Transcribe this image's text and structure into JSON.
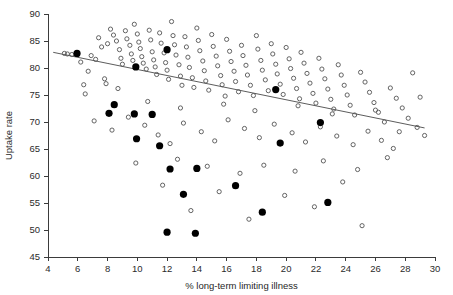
{
  "chart_data": {
    "type": "scatter",
    "title": "",
    "xlabel": "% long-term limiting illness",
    "ylabel": "Uptake rate",
    "xlim": [
      4,
      30
    ],
    "ylim": [
      45,
      90
    ],
    "xticks": [
      4,
      6,
      8,
      10,
      12,
      14,
      16,
      18,
      20,
      22,
      24,
      26,
      28,
      30
    ],
    "yticks": [
      45,
      50,
      55,
      60,
      65,
      70,
      75,
      80,
      85,
      90
    ],
    "grid": false,
    "legend": "none",
    "marker_colors": {
      "open_circle_stroke": "#545454",
      "solid_circle_fill": "#000000",
      "trend_line": "#4a4a4a",
      "axis": "#3b3b3b"
    },
    "series": [
      {
        "name": "open circles",
        "marker": "open-circle",
        "points": [
          [
            5.1,
            82.7
          ],
          [
            5.3,
            82.6
          ],
          [
            5.6,
            82.5
          ],
          [
            6.2,
            81.1
          ],
          [
            6.4,
            76.9
          ],
          [
            6.5,
            75.2
          ],
          [
            6.9,
            82.3
          ],
          [
            7.2,
            81.6
          ],
          [
            7.4,
            85.6
          ],
          [
            7.6,
            83.9
          ],
          [
            7.9,
            77.1
          ],
          [
            8.0,
            84.5
          ],
          [
            8.2,
            87.2
          ],
          [
            8.4,
            86.1
          ],
          [
            8.6,
            85.0
          ],
          [
            8.8,
            83.4
          ],
          [
            8.9,
            81.8
          ],
          [
            9.0,
            80.7
          ],
          [
            9.2,
            86.9
          ],
          [
            9.3,
            85.4
          ],
          [
            9.5,
            84.2
          ],
          [
            9.6,
            82.6
          ],
          [
            9.7,
            81.4
          ],
          [
            9.8,
            88.1
          ],
          [
            10.0,
            86.3
          ],
          [
            10.1,
            84.8
          ],
          [
            10.2,
            83.6
          ],
          [
            10.3,
            82.1
          ],
          [
            10.4,
            80.9
          ],
          [
            10.6,
            79.8
          ],
          [
            10.8,
            87.0
          ],
          [
            10.9,
            85.2
          ],
          [
            11.0,
            83.0
          ],
          [
            11.1,
            81.5
          ],
          [
            11.2,
            80.2
          ],
          [
            11.3,
            78.8
          ],
          [
            11.5,
            86.5
          ],
          [
            11.6,
            84.6
          ],
          [
            11.8,
            82.8
          ],
          [
            11.9,
            81.0
          ],
          [
            12.0,
            79.6
          ],
          [
            12.1,
            77.9
          ],
          [
            12.3,
            88.6
          ],
          [
            12.4,
            86.0
          ],
          [
            12.5,
            84.3
          ],
          [
            12.6,
            82.4
          ],
          [
            12.8,
            80.6
          ],
          [
            12.9,
            78.5
          ],
          [
            13.0,
            76.8
          ],
          [
            13.2,
            85.8
          ],
          [
            13.3,
            83.9
          ],
          [
            13.4,
            82.0
          ],
          [
            13.5,
            80.1
          ],
          [
            13.7,
            78.2
          ],
          [
            13.8,
            76.4
          ],
          [
            14.0,
            87.4
          ],
          [
            14.1,
            85.1
          ],
          [
            14.2,
            83.2
          ],
          [
            14.4,
            81.3
          ],
          [
            14.5,
            79.5
          ],
          [
            14.6,
            77.6
          ],
          [
            14.8,
            75.9
          ],
          [
            15.0,
            86.2
          ],
          [
            15.1,
            84.0
          ],
          [
            15.3,
            82.2
          ],
          [
            15.4,
            80.4
          ],
          [
            15.6,
            78.6
          ],
          [
            15.7,
            76.9
          ],
          [
            15.9,
            74.8
          ],
          [
            16.0,
            85.3
          ],
          [
            16.2,
            83.1
          ],
          [
            16.3,
            81.2
          ],
          [
            16.5,
            79.4
          ],
          [
            16.6,
            77.5
          ],
          [
            16.8,
            75.6
          ],
          [
            17.0,
            84.2
          ],
          [
            17.1,
            82.3
          ],
          [
            17.3,
            80.5
          ],
          [
            17.4,
            78.7
          ],
          [
            17.6,
            76.8
          ],
          [
            17.8,
            74.9
          ],
          [
            18.0,
            86.0
          ],
          [
            18.1,
            83.5
          ],
          [
            18.3,
            81.4
          ],
          [
            18.4,
            79.6
          ],
          [
            18.6,
            77.8
          ],
          [
            18.8,
            75.8
          ],
          [
            19.0,
            84.5
          ],
          [
            19.1,
            82.6
          ],
          [
            19.3,
            80.7
          ],
          [
            19.4,
            78.9
          ],
          [
            19.6,
            77.0
          ],
          [
            19.8,
            75.1
          ],
          [
            20.0,
            83.8
          ],
          [
            20.2,
            81.7
          ],
          [
            20.3,
            79.9
          ],
          [
            20.5,
            78.1
          ],
          [
            20.7,
            76.2
          ],
          [
            20.9,
            74.3
          ],
          [
            21.0,
            82.9
          ],
          [
            21.2,
            80.9
          ],
          [
            21.4,
            79.0
          ],
          [
            21.6,
            77.2
          ],
          [
            21.8,
            75.3
          ],
          [
            22.0,
            73.5
          ],
          [
            22.2,
            81.8
          ],
          [
            22.4,
            79.8
          ],
          [
            22.6,
            78.0
          ],
          [
            22.8,
            76.1
          ],
          [
            23.0,
            74.2
          ],
          [
            23.2,
            72.4
          ],
          [
            23.5,
            80.6
          ],
          [
            23.7,
            78.7
          ],
          [
            23.9,
            76.8
          ],
          [
            24.1,
            75.0
          ],
          [
            24.3,
            73.1
          ],
          [
            24.6,
            71.3
          ],
          [
            25.0,
            79.2
          ],
          [
            25.3,
            77.4
          ],
          [
            25.6,
            75.5
          ],
          [
            25.9,
            73.6
          ],
          [
            26.2,
            71.8
          ],
          [
            26.6,
            70.0
          ],
          [
            27.0,
            76.3
          ],
          [
            27.4,
            74.4
          ],
          [
            27.8,
            72.6
          ],
          [
            28.2,
            70.7
          ],
          [
            28.8,
            69.0
          ],
          [
            29.3,
            67.5
          ],
          [
            7.1,
            70.2
          ],
          [
            8.3,
            68.5
          ],
          [
            9.4,
            70.9
          ],
          [
            10.5,
            69.4
          ],
          [
            11.4,
            67.6
          ],
          [
            12.2,
            66.0
          ],
          [
            13.1,
            69.8
          ],
          [
            14.3,
            68.2
          ],
          [
            15.2,
            66.5
          ],
          [
            16.1,
            70.4
          ],
          [
            17.2,
            68.8
          ],
          [
            18.2,
            67.1
          ],
          [
            19.2,
            69.6
          ],
          [
            20.4,
            68.0
          ],
          [
            21.3,
            66.3
          ],
          [
            22.3,
            69.1
          ],
          [
            23.4,
            67.4
          ],
          [
            24.5,
            65.8
          ],
          [
            25.5,
            68.3
          ],
          [
            26.4,
            66.6
          ],
          [
            27.2,
            65.1
          ],
          [
            9.9,
            62.4
          ],
          [
            12.7,
            63.1
          ],
          [
            14.7,
            61.8
          ],
          [
            16.9,
            60.5
          ],
          [
            18.5,
            62.0
          ],
          [
            20.6,
            60.9
          ],
          [
            22.5,
            62.8
          ],
          [
            24.8,
            61.2
          ],
          [
            26.8,
            63.4
          ],
          [
            11.7,
            58.3
          ],
          [
            15.5,
            57.1
          ],
          [
            19.9,
            56.4
          ],
          [
            23.8,
            58.9
          ],
          [
            13.6,
            53.6
          ],
          [
            17.5,
            52.0
          ],
          [
            21.9,
            54.3
          ],
          [
            25.1,
            50.8
          ],
          [
            10.7,
            73.8
          ],
          [
            12.9,
            72.6
          ],
          [
            15.8,
            73.3
          ],
          [
            17.9,
            72.1
          ],
          [
            20.8,
            73.0
          ],
          [
            23.1,
            71.5
          ],
          [
            26.0,
            72.2
          ],
          [
            6.7,
            79.4
          ],
          [
            7.8,
            78.0
          ],
          [
            8.7,
            76.2
          ],
          [
            28.5,
            79.1
          ],
          [
            29.0,
            74.6
          ],
          [
            27.6,
            68.2
          ]
        ]
      },
      {
        "name": "solid circles",
        "marker": "solid-circle",
        "points": [
          [
            5.95,
            82.7
          ],
          [
            8.45,
            73.2
          ],
          [
            9.9,
            80.2
          ],
          [
            12.0,
            83.4
          ],
          [
            9.95,
            66.9
          ],
          [
            11.5,
            65.6
          ],
          [
            8.1,
            71.6
          ],
          [
            9.8,
            71.5
          ],
          [
            11.0,
            71.4
          ],
          [
            12.2,
            61.3
          ],
          [
            14.0,
            61.4
          ],
          [
            13.1,
            56.6
          ],
          [
            12.0,
            49.6
          ],
          [
            13.9,
            49.4
          ],
          [
            16.6,
            58.2
          ],
          [
            18.4,
            53.3
          ],
          [
            19.3,
            76.0
          ],
          [
            19.6,
            66.1
          ],
          [
            22.3,
            69.9
          ],
          [
            22.8,
            55.1
          ]
        ]
      }
    ],
    "trend_line": {
      "label": "fitted regression line",
      "x_start": 4.35,
      "y_start": 82.9,
      "x_end": 29.3,
      "y_end": 68.9
    }
  }
}
